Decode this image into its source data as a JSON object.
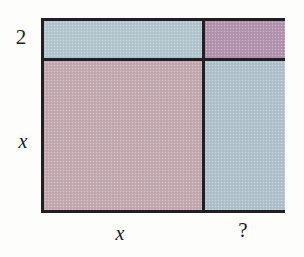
{
  "figure": {
    "type": "area-model-rectangle",
    "background_color": "#fdfdfb",
    "border_color": "#221f22"
  },
  "quadrants": [
    {
      "position": "top-left",
      "name": "top-left-cell",
      "fill_color": "#b4c6ce",
      "color_name": "blue-gray",
      "width_label": "x",
      "height_label": "2"
    },
    {
      "position": "top-right",
      "name": "top-right-cell",
      "fill_color": "#b494ae",
      "color_name": "mauve-purple",
      "width_label": "?",
      "height_label": "2"
    },
    {
      "position": "bottom-left",
      "name": "bottom-left-cell",
      "fill_color": "#c4aab2",
      "color_name": "dusty-rose",
      "width_label": "x",
      "height_label": "x"
    },
    {
      "position": "bottom-right",
      "name": "bottom-right-cell",
      "fill_color": "#b0c2cc",
      "color_name": "blue-gray",
      "width_label": "?",
      "height_label": "x"
    }
  ],
  "labels": {
    "height_top": "2",
    "height_bottom": "x",
    "width_left": "x",
    "width_right": "?"
  },
  "chart_data": {
    "type": "table",
    "title": "",
    "categories": [
      "x",
      "?"
    ],
    "row_labels": [
      "2",
      "x"
    ],
    "column_widths": [
      161,
      80
    ],
    "row_heights": [
      40,
      149
    ],
    "cells": [
      [
        "blue-gray",
        "mauve-purple"
      ],
      [
        "dusty-rose",
        "blue-gray"
      ]
    ]
  }
}
